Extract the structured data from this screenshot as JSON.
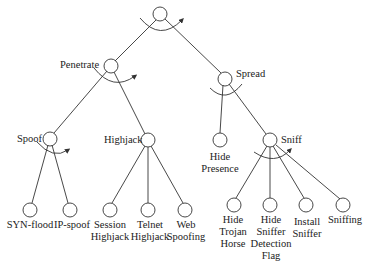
{
  "nodes": {
    "root": {
      "label": ""
    },
    "penetrate": {
      "label": "Penetrate"
    },
    "spread": {
      "label": "Spread"
    },
    "spoof": {
      "label": "Spoof"
    },
    "highjack": {
      "label": "Highjack"
    },
    "hide_presence": {
      "label": "Hide\nPresence"
    },
    "sniff": {
      "label": "Sniff"
    },
    "syn_flood": {
      "label": "SYN-flood"
    },
    "ip_spoof": {
      "label": "IP-spoof"
    },
    "session_highjack": {
      "label": "Session\nHighjack"
    },
    "telnet_highjack": {
      "label": "Telnet\nHighjack"
    },
    "web_spoofing": {
      "label": "Web\nSpoofing"
    },
    "hide_trojan_horse": {
      "label": "Hide\nTrojan\nHorse"
    },
    "hide_sniffer_detection_flag": {
      "label": "Hide\nSniffer\nDetection\nFlag"
    },
    "install_sniffer": {
      "label": "Install\nSniffer"
    },
    "sniffing": {
      "label": "Sniffing"
    }
  },
  "colors": {
    "stroke": "#333333",
    "text": "#222222"
  }
}
